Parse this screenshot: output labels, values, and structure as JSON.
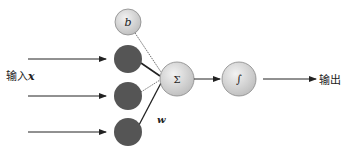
{
  "diagram": {
    "title": "",
    "input_label": "输入",
    "input_var": "x",
    "output_label": "输出",
    "weight_label": "w",
    "nodes": {
      "bias": {
        "label": "b",
        "cx": 128,
        "cy": 22,
        "r": 13,
        "fill": "#dcdcdc"
      },
      "inputs": [
        {
          "cx": 128,
          "cy": 59,
          "r": 14,
          "fill": "#555555"
        },
        {
          "cx": 128,
          "cy": 96,
          "r": 14,
          "fill": "#555555"
        },
        {
          "cx": 128,
          "cy": 132,
          "r": 14,
          "fill": "#555555"
        }
      ],
      "sum": {
        "label": "Σ",
        "cx": 177,
        "cy": 79,
        "r": 17,
        "fill": "#d8d8d8"
      },
      "activation": {
        "label": "∫",
        "cx": 239,
        "cy": 79,
        "r": 17,
        "fill": "#d8d8d8"
      }
    },
    "colors": {
      "input_node": "#555555",
      "light_node": "#d8d8d8",
      "edge": "#222222"
    }
  }
}
